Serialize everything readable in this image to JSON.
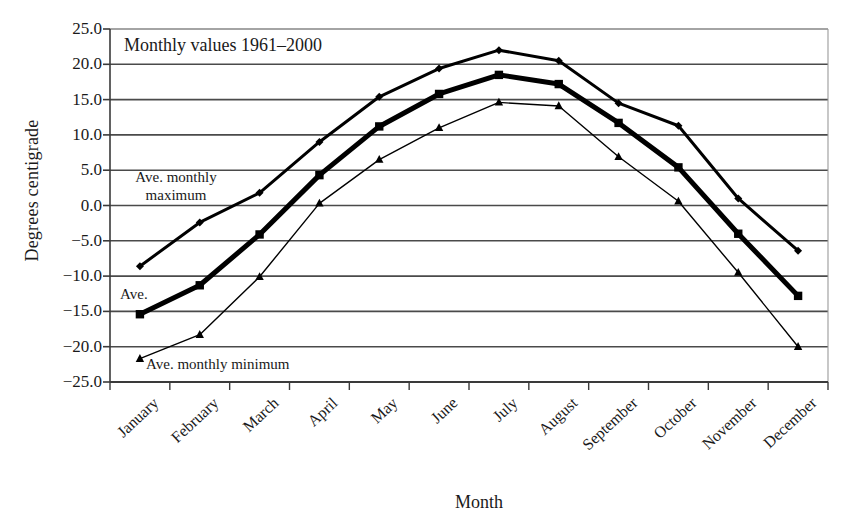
{
  "chart_data": {
    "type": "line",
    "title": "Monthly values 1961–2000",
    "xlabel": "Month",
    "ylabel": "Degrees centigrade",
    "ylim": [
      -25.0,
      25.0
    ],
    "ytick_step": 5.0,
    "grid": true,
    "legend_position": "inline-annotations",
    "categories": [
      "January",
      "February",
      "March",
      "April",
      "May",
      "June",
      "July",
      "August",
      "September",
      "October",
      "November",
      "December"
    ],
    "ytick_labels": [
      "25.0",
      "20.0",
      "15.0",
      "10.0",
      "5.0",
      "0.0",
      "−5.0",
      "−10.0",
      "−15.0",
      "−20.0",
      "−25.0"
    ],
    "ytick_values": [
      25.0,
      20.0,
      15.0,
      10.0,
      5.0,
      0.0,
      -5.0,
      -10.0,
      -15.0,
      -20.0,
      -25.0
    ],
    "series": [
      {
        "name": "Ave. monthly maximum",
        "marker": "diamond",
        "line_width": 3,
        "values": [
          -8.6,
          -2.4,
          1.8,
          9.0,
          15.4,
          19.4,
          22.0,
          20.5,
          14.5,
          11.3,
          1.0,
          -6.4
        ]
      },
      {
        "name": "Ave.",
        "marker": "square",
        "line_width": 5,
        "values": [
          -15.4,
          -11.3,
          -4.1,
          4.3,
          11.2,
          15.8,
          18.5,
          17.2,
          11.7,
          5.4,
          -4.0,
          -12.8
        ]
      },
      {
        "name": "Ave. monthly minimum",
        "marker": "triangle",
        "line_width": 1.4,
        "values": [
          -21.7,
          -18.3,
          -10.1,
          0.3,
          6.5,
          11.0,
          14.6,
          14.1,
          6.9,
          0.6,
          -9.5,
          -20.0
        ]
      }
    ],
    "annotations": [
      {
        "text_line1": "Ave. monthly",
        "text_line2": "maximum",
        "name": "ave-monthly-maximum-label"
      },
      {
        "text_line1": "Ave.",
        "text_line2": "",
        "name": "ave-label"
      },
      {
        "text_line1": "Ave. monthly minimum",
        "text_line2": "",
        "name": "ave-monthly-minimum-label"
      }
    ],
    "colors": {
      "line": "#000000",
      "grid": "#4a4a4a",
      "axis": "#3a3a3a",
      "background": "#ffffff",
      "text": "#1a1a1a"
    }
  }
}
